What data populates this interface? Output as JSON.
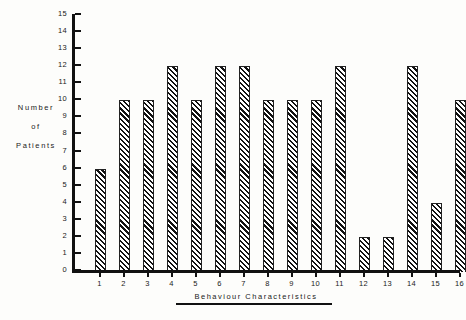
{
  "chart_data": {
    "type": "bar",
    "title": "",
    "subtitle": "",
    "xlabel": "Behaviour   Characteristics",
    "ylabel": "Number of Patients",
    "ylabel_lines": [
      "Number",
      "of",
      "Patients"
    ],
    "categories": [
      "1",
      "2",
      "3",
      "4",
      "5",
      "6",
      "7",
      "8",
      "9",
      "10",
      "11",
      "12",
      "13",
      "14",
      "15",
      "16"
    ],
    "values": [
      6,
      10,
      10,
      12,
      10,
      12,
      12,
      10,
      10,
      10,
      12,
      2,
      2,
      12,
      4,
      10
    ],
    "ylim": [
      0,
      15
    ],
    "y_ticks": [
      0,
      1,
      2,
      3,
      4,
      5,
      6,
      7,
      8,
      9,
      10,
      11,
      12,
      13,
      14,
      15
    ],
    "y_tick_labels": [
      "0",
      "1",
      "2",
      "3",
      "4",
      "5",
      "6",
      "7",
      "8",
      "9",
      "10",
      "11",
      "12",
      "13",
      "14",
      "15"
    ],
    "grid": false,
    "legend": null,
    "legend_position": "none",
    "bar_fill": "diagonal-hatch",
    "bar_color": "#111111",
    "background": "#fdfdfb",
    "axis_color": "#111111"
  }
}
